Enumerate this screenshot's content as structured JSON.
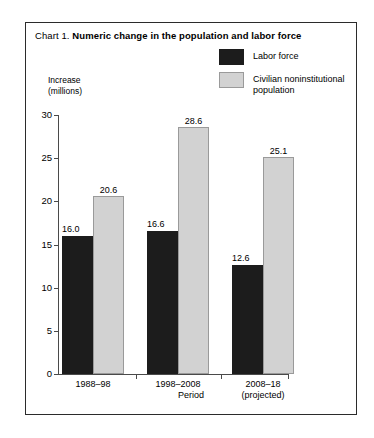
{
  "figure": {
    "title_prefix": "Chart 1.",
    "title_main": "Numeric change in the population and labor force"
  },
  "legend": {
    "items": [
      {
        "label": "Labor force",
        "swatch": "dark",
        "color": "#1c1c1c"
      },
      {
        "label": "Civilian noninstitutional population",
        "swatch": "light",
        "color": "#d2d2d2"
      }
    ]
  },
  "axes": {
    "y_title": "Increase\n(millions)",
    "x_title": "Period",
    "y_ticks": [
      "0",
      "5",
      "10",
      "15",
      "20",
      "25",
      "30"
    ]
  },
  "chart_data": {
    "type": "bar",
    "title": "Chart 1. Numeric change in the population and labor force",
    "xlabel": "Period",
    "ylabel": "Increase (millions)",
    "ylim": [
      0,
      30
    ],
    "ytick_step": 5,
    "grid": false,
    "legend_position": "top-right",
    "categories": [
      "1988–98",
      "1998–2008",
      "2008–18\n(projected)"
    ],
    "series": [
      {
        "name": "Labor force",
        "color": "#1c1c1c",
        "values": [
          16.0,
          16.6,
          12.6
        ],
        "labels": [
          "16.0",
          "16.6",
          "12.6"
        ]
      },
      {
        "name": "Civilian noninstitutional population",
        "color": "#d2d2d2",
        "values": [
          20.6,
          28.6,
          25.1
        ],
        "labels": [
          "20.6",
          "28.6",
          "25.1"
        ]
      }
    ]
  }
}
